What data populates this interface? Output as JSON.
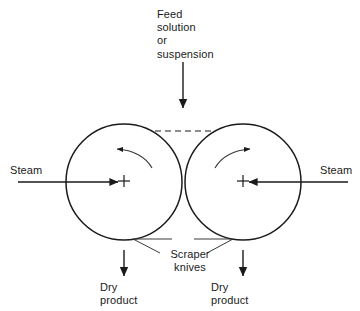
{
  "diagram": {
    "type": "process-flow",
    "colors": {
      "background": "#ffffff",
      "stroke": "#1a1a1a",
      "text": "#1a1a1a",
      "dashed_line": "#8c8c8c"
    },
    "labels": {
      "feed": "Feed\nsolution\nor\nsuspension",
      "steam_left": "Steam",
      "steam_right": "Steam",
      "scraper": "Scraper\nknives",
      "dry_product_left": "Dry\nproduct",
      "dry_product_right": "Dry\nproduct"
    },
    "drums": [
      {
        "name": "left-drum",
        "cx": 124,
        "cy": 182,
        "r": 58,
        "rotation": "counterclockwise"
      },
      {
        "name": "right-drum",
        "cx": 243,
        "cy": 182,
        "r": 58,
        "rotation": "clockwise"
      }
    ],
    "flows": [
      {
        "name": "feed-inlet",
        "direction": "down",
        "x": 183,
        "from_y": 62,
        "to_y": 108
      },
      {
        "name": "steam-inlet-left",
        "direction": "right",
        "y": 182,
        "from_x": 18,
        "to_x": 118
      },
      {
        "name": "steam-inlet-right",
        "direction": "left",
        "y": 182,
        "from_x": 348,
        "to_x": 249
      },
      {
        "name": "product-outlet-left",
        "direction": "down",
        "x": 124,
        "from_y": 250,
        "to_y": 276
      },
      {
        "name": "product-outlet-right",
        "direction": "down",
        "x": 243,
        "from_y": 250,
        "to_y": 276
      }
    ],
    "nip_gap": {
      "name": "drum-nip-gap",
      "x1": 155,
      "x2": 212,
      "y": 131,
      "style": "dashed"
    }
  }
}
